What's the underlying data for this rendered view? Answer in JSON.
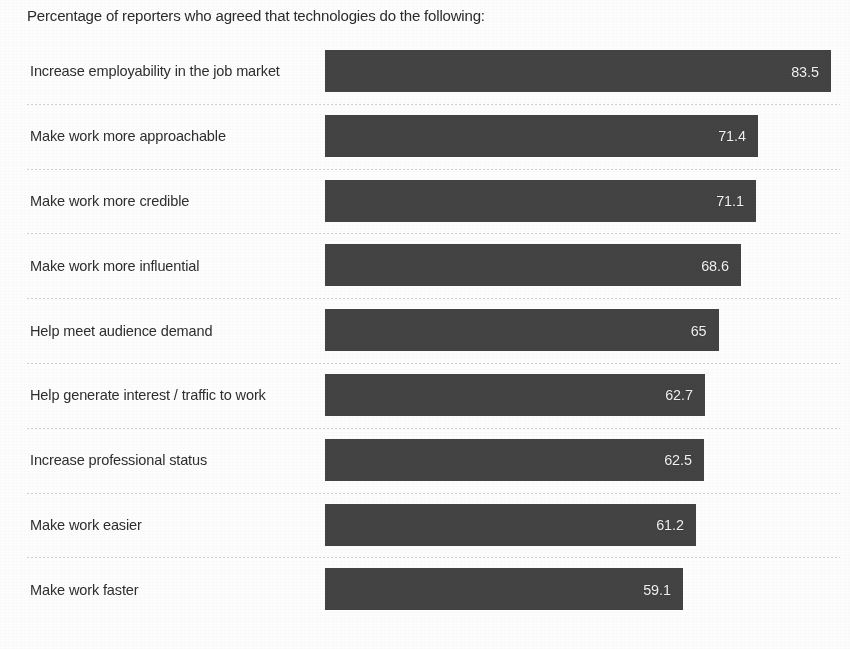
{
  "chart_title": "Percentage of reporters who agreed that technologies do the following:",
  "style": {
    "bar_color": "#434343",
    "value_label_color": "#f2f2f2",
    "category_label_color": "#2e2e2e",
    "background_color": "#fdfdfd",
    "separator_color": "#787878"
  },
  "axis": {
    "bar_origin_px": 325,
    "max_bar_end_px": 831,
    "px_per_unit": 6.06
  },
  "chart_data": {
    "type": "bar",
    "orientation": "horizontal",
    "title": "Percentage of reporters who agreed that technologies do the following:",
    "xlabel": "",
    "ylabel": "",
    "xlim": [
      0,
      83.5
    ],
    "grid": false,
    "legend": false,
    "value_labels_shown": true,
    "categories": [
      "Increase employability in the job market",
      "Make work more approachable",
      "Make work more credible",
      "Make work more influential",
      "Help meet audience demand",
      "Help generate interest / traffic to work",
      "Increase professional status",
      "Make work easier",
      "Make work faster"
    ],
    "values": [
      83.5,
      71.4,
      71.1,
      68.6,
      65,
      62.7,
      62.5,
      61.2,
      59.1
    ],
    "value_labels": [
      "83.5",
      "71.4",
      "71.1",
      "68.6",
      "65",
      "62.7",
      "62.5",
      "61.2",
      "59.1"
    ]
  },
  "rows": [
    {
      "label": "Increase employability in the job market",
      "value": 83.5,
      "value_label": "83.5",
      "separator": false
    },
    {
      "label": "Make work more approachable",
      "value": 71.4,
      "value_label": "71.4",
      "separator": true
    },
    {
      "label": "Make work more credible",
      "value": 71.1,
      "value_label": "71.1",
      "separator": true
    },
    {
      "label": "Make work more influential",
      "value": 68.6,
      "value_label": "68.6",
      "separator": true
    },
    {
      "label": "Help meet audience demand",
      "value": 65,
      "value_label": "65",
      "separator": true
    },
    {
      "label": "Help generate interest / traffic to work",
      "value": 62.7,
      "value_label": "62.7",
      "separator": true
    },
    {
      "label": "Increase professional status",
      "value": 62.5,
      "value_label": "62.5",
      "separator": true
    },
    {
      "label": "Make work easier",
      "value": 61.2,
      "value_label": "61.2",
      "separator": true
    },
    {
      "label": "Make work faster",
      "value": 59.1,
      "value_label": "59.1",
      "separator": true
    }
  ]
}
